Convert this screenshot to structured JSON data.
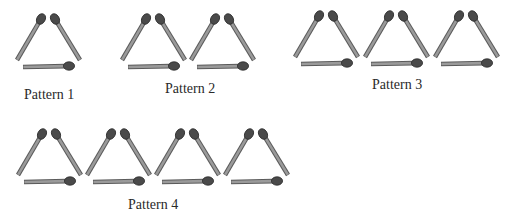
{
  "diagram": {
    "colors": {
      "stick": "#9a9a9a",
      "stick_edge": "#5a5a5a",
      "head": "#4a4a4a",
      "head_edge": "#2a2a2a",
      "text": "#2a2a2a"
    },
    "patterns": [
      {
        "label": "Pattern 1",
        "triangles": 1,
        "origin": [
          17,
          16
        ],
        "spacing": 69,
        "label_pos": [
          24,
          88
        ]
      },
      {
        "label": "Pattern 2",
        "triangles": 2,
        "origin": [
          122,
          16
        ],
        "spacing": 69,
        "label_pos": [
          165,
          82
        ]
      },
      {
        "label": "Pattern 3",
        "triangles": 3,
        "origin": [
          295,
          13
        ],
        "spacing": 70,
        "label_pos": [
          372,
          78
        ]
      },
      {
        "label": "Pattern 4",
        "triangles": 4,
        "origin": [
          18,
          131
        ],
        "spacing": 69,
        "label_pos": [
          128,
          198
        ]
      }
    ]
  }
}
